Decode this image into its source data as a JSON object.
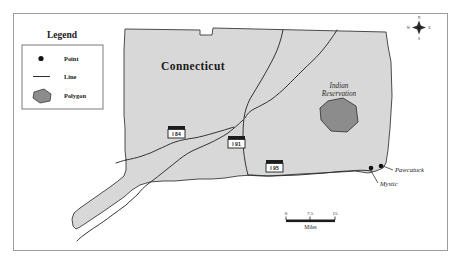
{
  "figure": {
    "type": "thematic-reference-map",
    "title_on_map": "Connecticut",
    "background_color": "#ffffff",
    "frame_color": "#9b9b9b"
  },
  "legend": {
    "title": "Legend",
    "items": [
      {
        "symbol": "point",
        "label": "Point"
      },
      {
        "symbol": "line",
        "label": "Line"
      },
      {
        "symbol": "polygon",
        "label": "Polygon"
      }
    ]
  },
  "map": {
    "state_label": "Connecticut",
    "state_fill": "#d8d8d8",
    "state_outline": "#3a3a3a",
    "river_color": "#2b2b2b",
    "polygon_label": "Indian Reservation",
    "polygon_fill": "#8c8c8c",
    "polygon_outline": "#3a3a3a"
  },
  "cities": [
    {
      "name": "Pawcatuck"
    },
    {
      "name": "Mystic"
    }
  ],
  "highways": [
    {
      "shield_label": "I 84"
    },
    {
      "shield_label": "I 91"
    },
    {
      "shield_label": "I 95"
    }
  ],
  "scale_bar": {
    "ticks": [
      "0",
      "7.5",
      "15"
    ],
    "unit_label": "Miles"
  },
  "compass": {
    "north": "N",
    "south": "S",
    "east": "E",
    "west": "W"
  }
}
